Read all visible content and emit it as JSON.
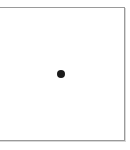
{
  "canvas": {
    "border_color": "#9a9a9a",
    "background": "#ffffff"
  },
  "marker": {
    "icon": "dot-icon",
    "color": "#1a1a1a"
  }
}
